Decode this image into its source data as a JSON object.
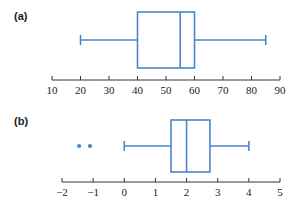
{
  "figure": {
    "background_color": "#ffffff",
    "box_color": "#4a86c8",
    "axis_color": "#333333",
    "text_color": "#1a1a1a"
  },
  "panels": [
    {
      "label": "(a)",
      "name": "panel-a"
    },
    {
      "label": "(b)",
      "name": "panel-b"
    }
  ],
  "chart_data": [
    {
      "type": "boxplot",
      "title": "(a)",
      "xlabel": "",
      "ylabel": "",
      "xlim": [
        10,
        90
      ],
      "xticks": [
        10,
        20,
        30,
        40,
        50,
        60,
        70,
        80,
        90
      ],
      "xticklabels": [
        "10",
        "20",
        "30",
        "40",
        "50",
        "60",
        "70",
        "80",
        "90"
      ],
      "grid": false,
      "legend": "none",
      "orientation": "horizontal",
      "boxes": [
        {
          "whisker_low": 20,
          "q1": 40,
          "median": 55,
          "q3": 60,
          "whisker_high": 85,
          "outliers": []
        }
      ]
    },
    {
      "type": "boxplot",
      "title": "(b)",
      "xlabel": "",
      "ylabel": "",
      "xlim": [
        -2,
        5
      ],
      "xticks": [
        -2,
        -1,
        0,
        1,
        2,
        3,
        4,
        5
      ],
      "xticklabels": [
        "−2",
        "−1",
        "0",
        "1",
        "2",
        "3",
        "4",
        "5"
      ],
      "grid": false,
      "legend": "none",
      "orientation": "horizontal",
      "boxes": [
        {
          "whisker_low": 0,
          "q1": 1.5,
          "median": 2.0,
          "q3": 2.75,
          "whisker_high": 4,
          "outliers": [
            -1.45,
            -1.1
          ]
        }
      ]
    }
  ]
}
